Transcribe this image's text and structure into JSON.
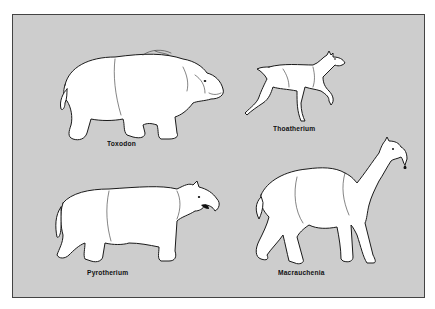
{
  "figure": {
    "background_color": "#cdcdcd",
    "border_color": "#444444",
    "animals": [
      {
        "name": "Toxodon",
        "position": "top-left"
      },
      {
        "name": "Thoatherium",
        "position": "top-right"
      },
      {
        "name": "Pyrotherium",
        "position": "bottom-left"
      },
      {
        "name": "Macrauchenia",
        "position": "bottom-right"
      }
    ]
  }
}
